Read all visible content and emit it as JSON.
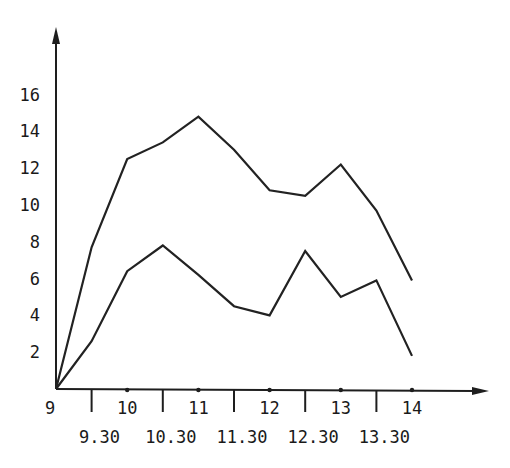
{
  "chart_data": {
    "type": "line",
    "title": "",
    "xlabel": "",
    "ylabel": "",
    "x": [
      "9",
      "9.30",
      "10",
      "10.30",
      "11",
      "11.30",
      "12",
      "12.30",
      "13",
      "13.30",
      "14"
    ],
    "x_numeric": [
      9,
      9.5,
      10,
      10.5,
      11,
      11.5,
      12,
      12.5,
      13,
      13.5,
      14
    ],
    "series": [
      {
        "name": "upper",
        "values": [
          0,
          7.7,
          12.5,
          13.4,
          14.8,
          13.0,
          10.8,
          10.5,
          12.2,
          9.7,
          5.9
        ]
      },
      {
        "name": "lower",
        "values": [
          0,
          2.6,
          6.4,
          7.8,
          6.2,
          4.5,
          4.0,
          7.5,
          5.0,
          5.9,
          1.8
        ]
      }
    ],
    "x_tick_labels_hour": [
      "9",
      "10",
      "11",
      "12",
      "13",
      "14"
    ],
    "x_tick_labels_half": [
      "9.30",
      "10.30",
      "11.30",
      "12.30",
      "13.30"
    ],
    "y_tick_labels": [
      "2",
      "4",
      "6",
      "8",
      "10",
      "12",
      "14",
      "16"
    ],
    "y_ticks": [
      2,
      4,
      6,
      8,
      10,
      12,
      14,
      16
    ],
    "xlim": [
      9,
      15.1
    ],
    "ylim": [
      0,
      19.5
    ],
    "grid": false,
    "legend": null
  }
}
